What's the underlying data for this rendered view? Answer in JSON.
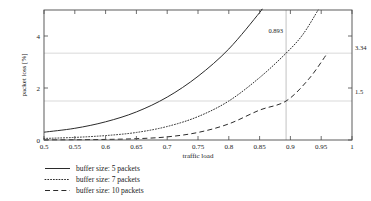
{
  "chart_data": {
    "type": "line",
    "title": "",
    "xlabel": "traffic load",
    "ylabel": "packet loss [%]",
    "xlim": [
      0.5,
      1.0
    ],
    "ylim": [
      0,
      5
    ],
    "xticks": [
      "0.5",
      "0.55",
      "0.6",
      "0.65",
      "0.7",
      "0.75",
      "0.8",
      "0.85",
      "0.9",
      "0.95",
      "1"
    ],
    "xtick_values": [
      0.5,
      0.55,
      0.6,
      0.65,
      0.7,
      0.75,
      0.8,
      0.85,
      0.9,
      0.95,
      1.0
    ],
    "yticks": [
      "0",
      "2",
      "4"
    ],
    "ytick_values": [
      0,
      2,
      4
    ],
    "grid": "horizontal-at-annotations",
    "legend_position": "below-plot-left",
    "series": [
      {
        "name": "buffer size: 5 packets",
        "style": "solid",
        "x": [
          0.5,
          0.55,
          0.6,
          0.65,
          0.7,
          0.75,
          0.8,
          0.85,
          0.852
        ],
        "y": [
          0.3,
          0.45,
          0.7,
          1.08,
          1.65,
          2.45,
          3.5,
          4.9,
          5.0
        ]
      },
      {
        "name": "buffer size: 7 packets",
        "style": "dotted",
        "x": [
          0.5,
          0.55,
          0.6,
          0.65,
          0.7,
          0.75,
          0.8,
          0.85,
          0.893,
          0.92,
          0.945
        ],
        "y": [
          0.06,
          0.1,
          0.17,
          0.29,
          0.52,
          0.9,
          1.5,
          2.4,
          3.34,
          4.05,
          5.0
        ]
      },
      {
        "name": "buffer size: 10 packets",
        "style": "dashed",
        "x": [
          0.5,
          0.55,
          0.6,
          0.65,
          0.7,
          0.75,
          0.8,
          0.85,
          0.893,
          0.93,
          0.96
        ],
        "y": [
          0.005,
          0.01,
          0.022,
          0.05,
          0.12,
          0.29,
          0.62,
          1.15,
          1.5,
          2.35,
          3.34
        ]
      }
    ],
    "annotations": [
      {
        "name": "vertical-marker",
        "label": "0.893",
        "x": 0.893,
        "type": "vline"
      },
      {
        "name": "gridline-upper",
        "label": "3.34",
        "y": 3.34,
        "type": "hline"
      },
      {
        "name": "gridline-lower",
        "label": "1.5",
        "y": 1.5,
        "type": "hline"
      }
    ]
  },
  "legend": {
    "items": [
      {
        "label": "buffer size: 5 packets",
        "style": "solid"
      },
      {
        "label": "buffer size: 7 packets",
        "style": "dotted"
      },
      {
        "label": "buffer size: 10 packets",
        "style": "dashed"
      }
    ]
  },
  "colors": {
    "curve": "#2b2b2b",
    "frame": "#4a4a4a",
    "grid": "#c8c8c8",
    "vline": "#a8a8a8",
    "background": "#ffffff"
  }
}
